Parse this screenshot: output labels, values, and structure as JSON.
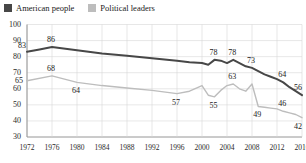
{
  "legend": {
    "position": "top-left",
    "items": [
      {
        "label": "American people",
        "color": "#474747",
        "icon": "square-swatch"
      },
      {
        "label": "Political leaders",
        "color": "#bdbdbd",
        "icon": "square-swatch"
      }
    ]
  },
  "chart_data": {
    "type": "line",
    "title": "",
    "subtitle": "",
    "xlabel": "",
    "ylabel": "",
    "xlim": [
      1972,
      2016
    ],
    "ylim": [
      30,
      100
    ],
    "yticks": [
      30,
      40,
      50,
      60,
      70,
      80,
      90,
      100
    ],
    "xticks": [
      1972,
      1976,
      1980,
      1984,
      1988,
      1992,
      1996,
      2000,
      2004,
      2008,
      2012,
      2016
    ],
    "grid": true,
    "series": [
      {
        "name": "American people",
        "color": "#474747",
        "width": 2.0,
        "x": [
          1972,
          1974,
          1976,
          1980,
          1984,
          1988,
          1992,
          1996,
          1998,
          2000,
          2001,
          2002,
          2003,
          2004,
          2005,
          2006,
          2007,
          2008,
          2009,
          2010,
          2011,
          2012,
          2013,
          2014,
          2015,
          2016
        ],
        "y": [
          83,
          84.5,
          86,
          84,
          82,
          80.5,
          79,
          77.5,
          76.5,
          76,
          75,
          78,
          77.5,
          76,
          78,
          76,
          74,
          73,
          71,
          69,
          67.5,
          66,
          64,
          61,
          58.5,
          56
        ],
        "labels": [
          {
            "x": 1972,
            "y": 83,
            "text": "83",
            "pos": "above-left"
          },
          {
            "x": 1976,
            "y": 86,
            "text": "86",
            "pos": "above"
          },
          {
            "x": 2002,
            "y": 78,
            "text": "78",
            "pos": "above"
          },
          {
            "x": 2005,
            "y": 78,
            "text": "78",
            "pos": "above"
          },
          {
            "x": 2008,
            "y": 73,
            "text": "73",
            "pos": "above"
          },
          {
            "x": 2013,
            "y": 64,
            "text": "64",
            "pos": "above"
          },
          {
            "x": 2016,
            "y": 56,
            "text": "56",
            "pos": "above"
          }
        ]
      },
      {
        "name": "Political leaders",
        "color": "#bdbdbd",
        "width": 1.4,
        "x": [
          1972,
          1976,
          1980,
          1984,
          1988,
          1992,
          1996,
          1998,
          2000,
          2001,
          2002,
          2003,
          2004,
          2005,
          2006,
          2007,
          2008,
          2009,
          2010,
          2011,
          2012,
          2013,
          2014,
          2015,
          2016
        ],
        "y": [
          65,
          68,
          64,
          62,
          60.5,
          59,
          57,
          58.5,
          62,
          56,
          55,
          59,
          62,
          63,
          60,
          58.5,
          63,
          49,
          48.5,
          48,
          47.5,
          46,
          45,
          44,
          42
        ],
        "labels": [
          {
            "x": 1972,
            "y": 65,
            "text": "65",
            "pos": "left"
          },
          {
            "x": 1976,
            "y": 68,
            "text": "68",
            "pos": "above"
          },
          {
            "x": 1980,
            "y": 64,
            "text": "64",
            "pos": "below"
          },
          {
            "x": 1996,
            "y": 57,
            "text": "57",
            "pos": "below"
          },
          {
            "x": 2002,
            "y": 55,
            "text": "55",
            "pos": "below"
          },
          {
            "x": 2005,
            "y": 63,
            "text": "63",
            "pos": "above"
          },
          {
            "x": 2009,
            "y": 49,
            "text": "49",
            "pos": "below"
          },
          {
            "x": 2013,
            "y": 46,
            "text": "46",
            "pos": "above"
          },
          {
            "x": 2016,
            "y": 42,
            "text": "42",
            "pos": "below"
          }
        ]
      }
    ]
  }
}
